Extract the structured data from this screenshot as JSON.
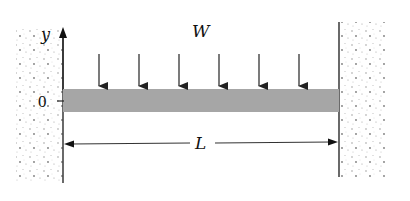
{
  "diagram": {
    "type": "fixed-fixed beam with uniform distributed load",
    "labels": {
      "load": "W",
      "axis_y": "y",
      "origin": "0",
      "length": "L"
    },
    "load_arrows": {
      "count": 6,
      "x_positions": [
        99,
        139,
        179,
        219,
        259,
        299
      ]
    },
    "colors": {
      "beam": "#a6a6a6",
      "lines": "#333333",
      "stipple": "#8a8a8a"
    }
  }
}
